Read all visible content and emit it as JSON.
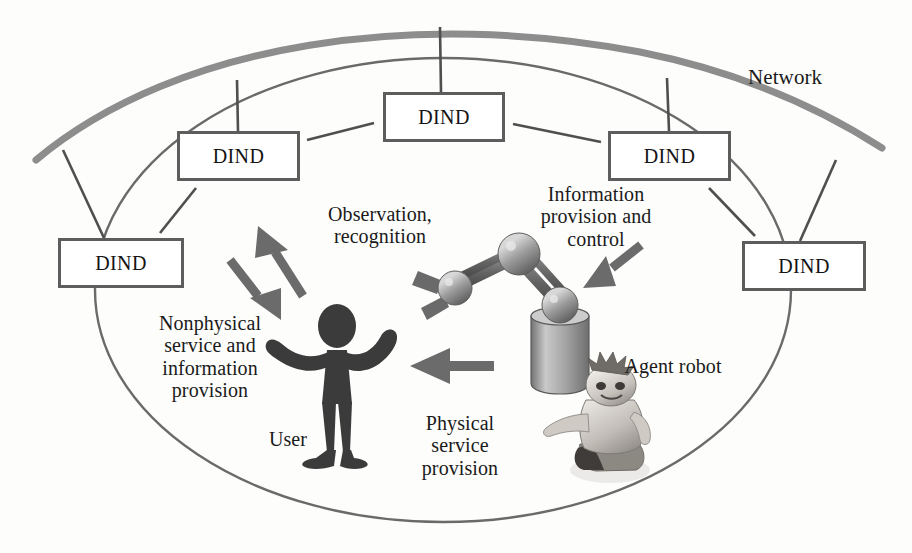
{
  "figure": {
    "background_color": "#fdfdfc",
    "ink_color": "#4f4f4f",
    "text_color": "#151515"
  },
  "network": {
    "label": "Network",
    "arc_color": "#8a8a8a"
  },
  "nodes": [
    {
      "id": "dind-top",
      "label": "DIND",
      "x": 383,
      "y": 92,
      "w": 122,
      "h": 50
    },
    {
      "id": "dind-upper-left",
      "label": "DIND",
      "x": 177,
      "y": 131,
      "w": 123,
      "h": 50
    },
    {
      "id": "dind-upper-right",
      "label": "DIND",
      "x": 608,
      "y": 131,
      "w": 123,
      "h": 50
    },
    {
      "id": "dind-left",
      "label": "DIND",
      "x": 58,
      "y": 238,
      "w": 126,
      "h": 50
    },
    {
      "id": "dind-right",
      "label": "DIND",
      "x": 742,
      "y": 241,
      "w": 124,
      "h": 50
    }
  ],
  "labels": {
    "observation": "Observation,\nrecognition",
    "information_provision": "Information\nprovision and\ncontrol",
    "nonphysical": "Nonphysical\nservice and\ninformation\nprovision",
    "physical": "Physical\nservice\nprovision",
    "user": "User",
    "agent_robot": "Agent robot"
  },
  "arrows": [
    {
      "name": "observation-arrow",
      "direction": "up-left",
      "meaning": "Observation, recognition"
    },
    {
      "name": "nonphysical-arrow",
      "direction": "down-right",
      "meaning": "Nonphysical service and information provision"
    },
    {
      "name": "information-arrow",
      "direction": "down-left",
      "meaning": "Information provision and control"
    },
    {
      "name": "physical-arrow",
      "direction": "left",
      "meaning": "Physical service provision"
    }
  ],
  "entities": [
    {
      "name": "user-figure",
      "kind": "stick-person"
    },
    {
      "name": "robot-arm",
      "kind": "articulated-manipulator"
    },
    {
      "name": "agent-robot",
      "kind": "humanoid-toy-robot"
    }
  ]
}
